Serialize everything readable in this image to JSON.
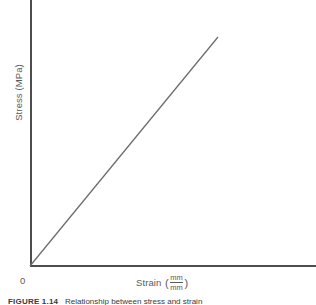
{
  "figure": {
    "caption_number": "FIGURE 1.14",
    "caption_text": "Relationship between stress and strain",
    "origin_label": "0"
  },
  "axes": {
    "y_label": "Stress (MPa)",
    "x_label_prefix": "Strain",
    "x_paren_open": "(",
    "x_paren_close": ")",
    "x_unit_numerator": "mm",
    "x_unit_denominator": "mm"
  },
  "colors": {
    "background": "#ffffff",
    "axis": "#4d4d4d",
    "line": "#6e6e6e",
    "label_text": "#5a5a5a",
    "caption_text": "#3a3a3a"
  },
  "chart_data": {
    "type": "line",
    "title": "",
    "xlabel": "Strain (mm/mm)",
    "ylabel": "Stress (MPa)",
    "xlim": [
      0,
      1
    ],
    "ylim": [
      0,
      1
    ],
    "grid": false,
    "legend": "none",
    "annotations": [
      "0"
    ],
    "series": [
      {
        "name": "Linear elastic stress-strain response",
        "x": [
          0,
          1
        ],
        "y": [
          0,
          1
        ],
        "color": "#6e6e6e",
        "style": "straight-line-through-origin"
      }
    ],
    "pixel_geometry": {
      "origin": [
        30,
        266
      ],
      "line_end": [
        218,
        37
      ],
      "y_axis_top": [
        30,
        0
      ],
      "x_axis_right": [
        316,
        266
      ]
    }
  }
}
